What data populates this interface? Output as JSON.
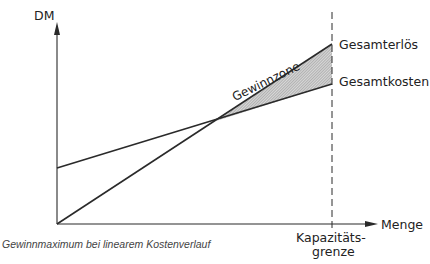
{
  "diagram": {
    "axes": {
      "y_label": "DM",
      "x_label": "Menge"
    },
    "lines": {
      "revenue_label": "Gesamterlös",
      "cost_label": "Gesamtkosten"
    },
    "zone_label": "Gewinnzone",
    "capacity_label_line1": "Kapazitäts-",
    "capacity_label_line2": "grenze",
    "caption": "Gewinnmaximum bei linearem Kostenverlauf"
  },
  "colors": {
    "line": "#2a2a2a",
    "hatch": "#9a9a9a"
  }
}
